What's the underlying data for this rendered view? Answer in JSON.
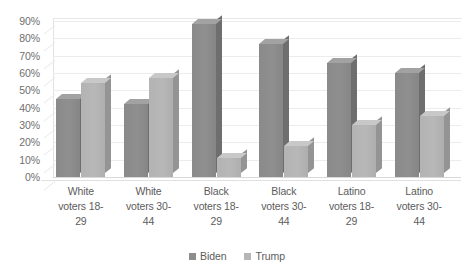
{
  "chart_data": {
    "type": "bar",
    "title": "",
    "subtitle": "",
    "xlabel": "",
    "ylabel": "",
    "ylim": [
      0,
      90
    ],
    "ytick_labels": [
      "90%",
      "80%",
      "70%",
      "60%",
      "50%",
      "40%",
      "30%",
      "20%",
      "10%",
      "0%"
    ],
    "ytick_values": [
      90,
      80,
      70,
      60,
      50,
      40,
      30,
      20,
      10,
      0
    ],
    "grid": true,
    "legend_position": "bottom",
    "style": "3d-clustered-column",
    "categories": [
      "White voters 18-29",
      "White voters 30-44",
      "Black voters 18-29",
      "Black voters 30-44",
      "Latino voters 18-29",
      "Latino voters 30-44"
    ],
    "category_lines": [
      [
        "White",
        "voters 18-",
        "29"
      ],
      [
        "White",
        "voters 30-",
        "44"
      ],
      [
        "Black",
        "voters 18-",
        "29"
      ],
      [
        "Black",
        "voters 30-",
        "44"
      ],
      [
        "Latino",
        "voters 18-",
        "29"
      ],
      [
        "Latino",
        "voters 30-",
        "44"
      ]
    ],
    "series": [
      {
        "name": "Biden",
        "color": "#8d8d8d",
        "values": [
          45,
          42,
          88,
          77,
          66,
          60
        ]
      },
      {
        "name": "Trump",
        "color": "#b6b6b6",
        "values": [
          54,
          57,
          11,
          18,
          30,
          35
        ]
      }
    ]
  },
  "legend": {
    "items": [
      {
        "label": "Biden",
        "swatch": "biden"
      },
      {
        "label": "Trump",
        "swatch": "trump"
      }
    ]
  }
}
